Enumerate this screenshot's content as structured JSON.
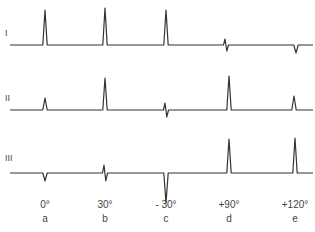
{
  "figure": {
    "leads": [
      {
        "label": "I",
        "baseline_y": 45,
        "label_x": 5,
        "label_y": 28,
        "complexes": [
          {
            "x": 45,
            "type": "up",
            "amp": 35
          },
          {
            "x": 105,
            "type": "up",
            "amp": 37
          },
          {
            "x": 166,
            "type": "up",
            "amp": 35
          },
          {
            "x": 226,
            "type": "biphasic",
            "amp": 6
          },
          {
            "x": 296,
            "type": "down",
            "amp": 8
          }
        ]
      },
      {
        "label": "II",
        "baseline_y": 110,
        "label_x": 5,
        "label_y": 93,
        "complexes": [
          {
            "x": 45,
            "type": "up",
            "amp": 12
          },
          {
            "x": 105,
            "type": "up",
            "amp": 32
          },
          {
            "x": 166,
            "type": "biphasic",
            "amp": 7
          },
          {
            "x": 229,
            "type": "up",
            "amp": 34
          },
          {
            "x": 294,
            "type": "up",
            "amp": 14
          }
        ]
      },
      {
        "label": "III",
        "baseline_y": 173,
        "label_x": 5,
        "label_y": 153,
        "complexes": [
          {
            "x": 45,
            "type": "down",
            "amp": 8
          },
          {
            "x": 105,
            "type": "biphasic",
            "amp": 8
          },
          {
            "x": 166,
            "type": "down",
            "amp": 30
          },
          {
            "x": 229,
            "type": "up",
            "amp": 34
          },
          {
            "x": 295,
            "type": "up",
            "amp": 35
          }
        ]
      }
    ],
    "axis_labels": [
      {
        "angle": "0°",
        "letter": "a",
        "x": 45
      },
      {
        "angle": "30°",
        "letter": "b",
        "x": 105
      },
      {
        "angle": "- 30°",
        "letter": "c",
        "x": 166
      },
      {
        "angle": "+90°",
        "letter": "d",
        "x": 229
      },
      {
        "angle": "+120°",
        "letter": "e",
        "x": 295
      }
    ]
  }
}
